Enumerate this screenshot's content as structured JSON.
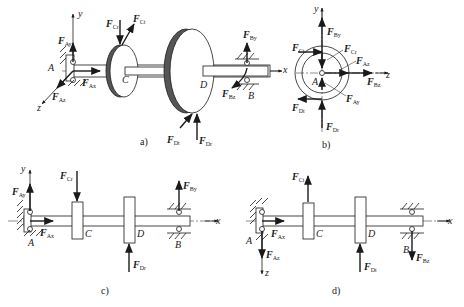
{
  "figure": {
    "panels": [
      {
        "id": "a",
        "caption": "a)",
        "description": "3D isometric view of shaft with two discs C and D on supports A and B"
      },
      {
        "id": "b",
        "caption": "b)",
        "description": "End view (y-z plane) showing forces around point A"
      },
      {
        "id": "c",
        "caption": "c)",
        "description": "Vertical plane (x-y) force diagram"
      },
      {
        "id": "d",
        "caption": "d)",
        "description": "Horizontal plane (x-z) force diagram"
      }
    ]
  },
  "panel_a": {
    "caption": "a)",
    "axes": {
      "x": "x",
      "y": "y",
      "z": "z"
    },
    "points": {
      "A": "A",
      "B": "B",
      "C": "C",
      "D": "D"
    },
    "forces": {
      "Ay": {
        "base": "F",
        "sub": "Ay"
      },
      "Ax": {
        "base": "F",
        "sub": "Ax"
      },
      "Az": {
        "base": "F",
        "sub": "Az"
      },
      "Cr": {
        "base": "F",
        "sub": "Cr"
      },
      "Ct": {
        "base": "F",
        "sub": "Ct"
      },
      "By": {
        "base": "F",
        "sub": "By"
      },
      "Bz": {
        "base": "F",
        "sub": "Bz"
      },
      "Dt": {
        "base": "F",
        "sub": "Dt"
      },
      "Dr": {
        "base": "F",
        "sub": "Dr"
      }
    }
  },
  "panel_b": {
    "caption": "b)",
    "axes": {
      "y": "y",
      "z": "z"
    },
    "points": {
      "A": "A"
    },
    "forces": {
      "By": {
        "base": "F",
        "sub": "By"
      },
      "Ct": {
        "base": "F",
        "sub": "Ct"
      },
      "Cr": {
        "base": "F",
        "sub": "Cr"
      },
      "Az": {
        "base": "F",
        "sub": "Az"
      },
      "Bz": {
        "base": "F",
        "sub": "Bz"
      },
      "Dt": {
        "base": "F",
        "sub": "Dt"
      },
      "Ay": {
        "base": "F",
        "sub": "Ay"
      },
      "Dr": {
        "base": "F",
        "sub": "Dr"
      }
    }
  },
  "panel_c": {
    "caption": "c)",
    "axes": {
      "x": "x",
      "y": "y"
    },
    "points": {
      "A": "A",
      "B": "B",
      "C": "C",
      "D": "D"
    },
    "forces": {
      "Ay": {
        "base": "F",
        "sub": "Ay"
      },
      "Ax": {
        "base": "F",
        "sub": "Ax"
      },
      "Cr": {
        "base": "F",
        "sub": "Cr"
      },
      "Dr": {
        "base": "F",
        "sub": "Dr"
      },
      "By": {
        "base": "F",
        "sub": "By"
      }
    }
  },
  "panel_d": {
    "caption": "d)",
    "axes": {
      "x": "x",
      "z": "z"
    },
    "points": {
      "A": "A",
      "B": "B",
      "C": "C",
      "D": "D"
    },
    "forces": {
      "Ct": {
        "base": "F",
        "sub": "Ct"
      },
      "Ax": {
        "base": "F",
        "sub": "Ax"
      },
      "Az": {
        "base": "F",
        "sub": "Az"
      },
      "Dt": {
        "base": "F",
        "sub": "Dt"
      },
      "Bz": {
        "base": "F",
        "sub": "Bz"
      }
    }
  },
  "colors": {
    "ink": "#1a1a1a",
    "disc_rim": "#555555",
    "background": "#ffffff"
  }
}
